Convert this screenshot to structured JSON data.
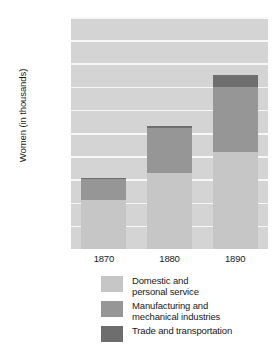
{
  "chart_data": {
    "type": "bar",
    "subtype": "stacked-bar",
    "title": "",
    "xlabel": "",
    "ylabel": "Women (in thousands)",
    "categories": [
      "1870",
      "1880",
      "1890"
    ],
    "ylim": [
      0,
      5000
    ],
    "ytick_values": [
      500,
      1000,
      1500,
      2000,
      2500,
      3000,
      3500,
      4000,
      4500,
      5000
    ],
    "ytick_labels": [
      "500",
      "1,000",
      "1,500",
      "2,000",
      "2,500",
      "3,000",
      "3,500",
      "4,000",
      "4,500",
      "5,000"
    ],
    "grid": true,
    "grid_color": "#f7f7f7",
    "plot_background": "#d4d4d4",
    "legend_position": "bottom",
    "series": [
      {
        "name": "Domestic and\npersonal service",
        "color": "#c6c6c6",
        "values": [
          1050,
          1640,
          2100
        ]
      },
      {
        "name": "Manufacturing and\nmechanical industries",
        "color": "#969696",
        "values": [
          450,
          960,
          1400
        ]
      },
      {
        "name": "Trade and transportation",
        "color": "#6e6e6e",
        "values": [
          20,
          50,
          250
        ]
      }
    ],
    "totals": [
      1520,
      2650,
      3750
    ]
  }
}
